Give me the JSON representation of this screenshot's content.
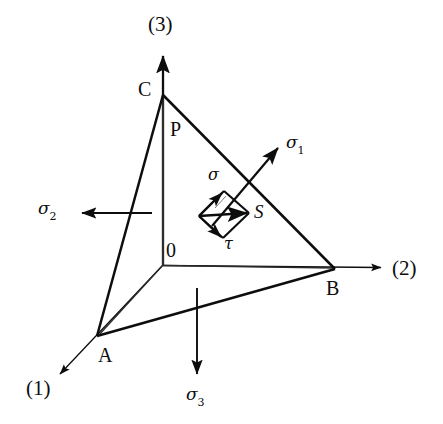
{
  "figure": {
    "background_color": "#ffffff",
    "line_color": "#0d0d0d",
    "axes": [
      {
        "name": "axis-1",
        "label": "(1)",
        "direction": "lower-left",
        "x": 26,
        "y": 378
      },
      {
        "name": "axis-2",
        "label": "(2)",
        "direction": "right",
        "x": 392,
        "y": 258
      },
      {
        "name": "axis-3",
        "label": "(3)",
        "direction": "up",
        "x": 148,
        "y": 14
      }
    ],
    "vertices": [
      {
        "name": "vertex-a",
        "label": "A",
        "x": 98,
        "y": 345
      },
      {
        "name": "vertex-b",
        "label": "B",
        "x": 326,
        "y": 278
      },
      {
        "name": "vertex-c",
        "label": "C",
        "x": 138,
        "y": 79
      },
      {
        "name": "origin",
        "label": "0",
        "x": 166,
        "y": 240
      },
      {
        "name": "plane-label",
        "label": "P",
        "x": 170,
        "y": 119
      },
      {
        "name": "traction-point",
        "label": "S",
        "x": 254,
        "y": 202
      }
    ],
    "stress_arrows": [
      {
        "name": "sigma-1",
        "base": "σ",
        "sub": "1",
        "x": 286,
        "y": 134
      },
      {
        "name": "sigma-2",
        "base": "σ",
        "sub": "2",
        "x": 38,
        "y": 200
      },
      {
        "name": "sigma-3",
        "base": "σ",
        "sub": "3",
        "x": 186,
        "y": 386
      }
    ],
    "components": [
      {
        "name": "normal-stress",
        "label": "σ",
        "x": 208,
        "y": 167
      },
      {
        "name": "shear-stress",
        "label": "τ",
        "x": 224,
        "y": 236
      }
    ]
  }
}
